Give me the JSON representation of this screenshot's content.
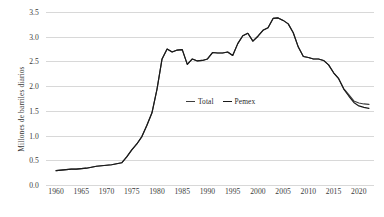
{
  "chart_data": {
    "type": "line",
    "title": "",
    "subtitle": "",
    "xlabel": "",
    "ylabel": "Millones de barriles diarios",
    "xlim": [
      1958,
      2023
    ],
    "ylim": [
      0.0,
      3.5
    ],
    "grid": true,
    "grid_axis": "y",
    "legend_position": "center",
    "y_ticks": [
      "0.0",
      "0.5",
      "1.0",
      "1.5",
      "2.0",
      "2.5",
      "3.0",
      "3.5"
    ],
    "y_tick_values": [
      0.0,
      0.5,
      1.0,
      1.5,
      2.0,
      2.5,
      3.0,
      3.5
    ],
    "x_ticks": [
      "1960",
      "1965",
      "1970",
      "1975",
      "1980",
      "1985",
      "1990",
      "1995",
      "2000",
      "2005",
      "2010",
      "2015",
      "2020"
    ],
    "x_tick_values": [
      1960,
      1965,
      1970,
      1975,
      1980,
      1985,
      1990,
      1995,
      2000,
      2005,
      2010,
      2015,
      2020
    ],
    "x": [
      1960,
      1961,
      1962,
      1963,
      1964,
      1965,
      1966,
      1967,
      1968,
      1969,
      1970,
      1971,
      1972,
      1973,
      1974,
      1975,
      1976,
      1977,
      1978,
      1979,
      1980,
      1981,
      1982,
      1983,
      1984,
      1985,
      1986,
      1987,
      1988,
      1989,
      1990,
      1991,
      1992,
      1993,
      1994,
      1995,
      1996,
      1997,
      1998,
      1999,
      2000,
      2001,
      2002,
      2003,
      2004,
      2005,
      2006,
      2007,
      2008,
      2009,
      2010,
      2011,
      2012,
      2013,
      2014,
      2015,
      2016,
      2017,
      2018,
      2019,
      2020,
      2021,
      2022
    ],
    "series": [
      {
        "name": "Total",
        "color": "#3d3d3d",
        "values": [
          0.29,
          0.3,
          0.31,
          0.32,
          0.32,
          0.33,
          0.34,
          0.36,
          0.38,
          0.39,
          0.4,
          0.41,
          0.43,
          0.45,
          0.57,
          0.71,
          0.83,
          0.98,
          1.21,
          1.46,
          1.94,
          2.55,
          2.75,
          2.69,
          2.73,
          2.74,
          2.44,
          2.55,
          2.51,
          2.52,
          2.55,
          2.68,
          2.67,
          2.67,
          2.69,
          2.62,
          2.86,
          3.02,
          3.07,
          2.91,
          3.01,
          3.13,
          3.18,
          3.37,
          3.38,
          3.33,
          3.26,
          3.08,
          2.79,
          2.6,
          2.58,
          2.55,
          2.55,
          2.52,
          2.43,
          2.27,
          2.15,
          1.95,
          1.83,
          1.7,
          1.66,
          1.64,
          1.63
        ]
      },
      {
        "name": "Pemex",
        "color": "#1a1a1a",
        "values": [
          0.29,
          0.3,
          0.31,
          0.32,
          0.32,
          0.33,
          0.34,
          0.36,
          0.38,
          0.39,
          0.4,
          0.41,
          0.43,
          0.45,
          0.57,
          0.71,
          0.83,
          0.98,
          1.21,
          1.46,
          1.94,
          2.55,
          2.75,
          2.69,
          2.73,
          2.74,
          2.44,
          2.55,
          2.51,
          2.52,
          2.55,
          2.68,
          2.67,
          2.67,
          2.69,
          2.62,
          2.86,
          3.02,
          3.07,
          2.91,
          3.01,
          3.13,
          3.18,
          3.37,
          3.38,
          3.33,
          3.26,
          3.08,
          2.79,
          2.6,
          2.58,
          2.55,
          2.55,
          2.52,
          2.43,
          2.27,
          2.15,
          1.94,
          1.8,
          1.67,
          1.6,
          1.57,
          1.55
        ]
      }
    ]
  },
  "legend": {
    "items": [
      {
        "label": "Total",
        "color": "#3d3d3d"
      },
      {
        "label": "Pemex",
        "color": "#1a1a1a"
      }
    ]
  }
}
